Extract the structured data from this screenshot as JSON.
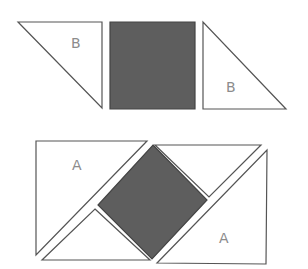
{
  "diagram": {
    "colors": {
      "stroke": "#555555",
      "dark_fill": "#5e5e5e",
      "light_fill": "#ffffff",
      "label": "#8c8c8c"
    },
    "top_row": {
      "left_triangle": {
        "label": "B",
        "points": "18,22 102,22 102,108",
        "label_pos": [
          71,
          48
        ]
      },
      "square": {
        "points": "110,22 195,22 195,109 110,109"
      },
      "right_triangle": {
        "label": "B",
        "points": "203,22 203,109 286,109",
        "label_pos": [
          226,
          92
        ]
      }
    },
    "bottom_assembly": {
      "triangle_a_left": {
        "label": "A",
        "points": "36,141 147,141 36,255",
        "label_pos": [
          72,
          170
        ]
      },
      "triangle_top_right": {
        "points": "155,145 261,145 209,197"
      },
      "diamond": {
        "points": "153,145 207,200 152,259 98,205"
      },
      "triangle_bottom_left": {
        "points": "95,209 150,260 42,260"
      },
      "triangle_a_right": {
        "label": "A",
        "points": "267,150 266,264 157,263",
        "label_pos": [
          219,
          243
        ]
      }
    }
  }
}
